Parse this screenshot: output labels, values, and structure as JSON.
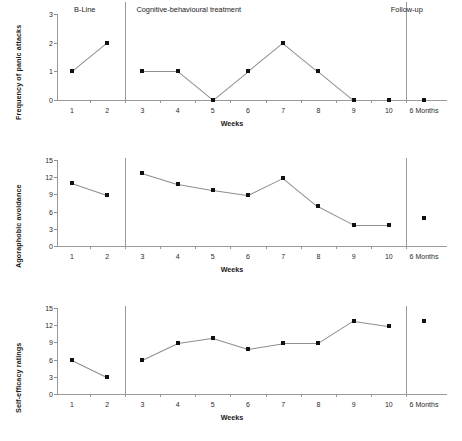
{
  "figure": {
    "xlabel": "Weeks",
    "x_categories": [
      "1",
      "2",
      "3",
      "4",
      "5",
      "6",
      "7",
      "8",
      "9",
      "10",
      "6 Months"
    ],
    "phases": [
      {
        "key": "baseline",
        "label": "B-Line"
      },
      {
        "key": "treatment",
        "label": "Cognitive-behavioural treatment"
      },
      {
        "key": "followup",
        "label": "Follow-up"
      }
    ]
  },
  "chart_data": [
    {
      "type": "line",
      "title": "",
      "ylabel": "Frequency of panic attacks",
      "xlabel": "Weeks",
      "ylim": [
        0,
        3
      ],
      "yticks": [
        "0",
        "1",
        "2",
        "3"
      ],
      "x": [
        "1",
        "2",
        "3",
        "4",
        "5",
        "6",
        "7",
        "8",
        "9",
        "10",
        "6 Months"
      ],
      "values": [
        1,
        2,
        1,
        1,
        0,
        1,
        2,
        1,
        0,
        0,
        0
      ],
      "segments": [
        [
          0,
          1
        ],
        [
          2,
          3
        ],
        [
          3,
          4
        ],
        [
          4,
          5
        ],
        [
          5,
          6
        ],
        [
          6,
          7
        ],
        [
          7,
          8
        ]
      ],
      "grid": false,
      "legend": "none",
      "phase_labels_shown": true
    },
    {
      "type": "line",
      "title": "",
      "ylabel": "Agoraphobic avoidance",
      "xlabel": "Weeks",
      "ylim": [
        0,
        15
      ],
      "yticks": [
        "0",
        "3",
        "6",
        "9",
        "12",
        "15"
      ],
      "x": [
        "1",
        "2",
        "3",
        "4",
        "5",
        "6",
        "7",
        "8",
        "9",
        "10",
        "6 Months"
      ],
      "values": [
        11,
        8.9,
        12.8,
        10.9,
        9.8,
        8.9,
        11.9,
        6.9,
        3.7,
        3.7,
        4.8
      ],
      "segments": [
        [
          0,
          1
        ],
        [
          2,
          3
        ],
        [
          3,
          4
        ],
        [
          4,
          5
        ],
        [
          5,
          6
        ],
        [
          6,
          7
        ],
        [
          7,
          8
        ],
        [
          8,
          9
        ]
      ],
      "grid": false,
      "legend": "none",
      "phase_labels_shown": false
    },
    {
      "type": "line",
      "title": "",
      "ylabel": "Self-efficacy ratings",
      "xlabel": "Weeks",
      "ylim": [
        0,
        15
      ],
      "yticks": [
        "0",
        "3",
        "6",
        "9",
        "12",
        "15"
      ],
      "x": [
        "1",
        "2",
        "3",
        "4",
        "5",
        "6",
        "7",
        "8",
        "9",
        "10",
        "6 Months"
      ],
      "values": [
        6,
        3,
        6,
        8.9,
        9.8,
        7.9,
        8.9,
        8.9,
        12.8,
        11.9,
        12.8
      ],
      "segments": [
        [
          0,
          1
        ],
        [
          2,
          3
        ],
        [
          3,
          4
        ],
        [
          4,
          5
        ],
        [
          5,
          6
        ],
        [
          6,
          7
        ],
        [
          7,
          8
        ],
        [
          8,
          9
        ]
      ],
      "grid": false,
      "legend": "none",
      "phase_labels_shown": false
    }
  ]
}
